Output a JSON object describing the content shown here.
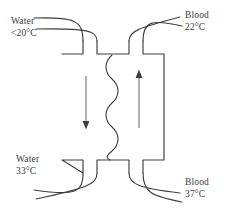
{
  "diagram": {
    "stroke_color": "#3f3f3f",
    "text_color": "#3a3a3a",
    "background_color": "#ffffff",
    "labels": {
      "water_cold": {
        "fluid": "Water",
        "temperature": "<20°C"
      },
      "blood_in": {
        "fluid": "Blood",
        "temperature": "22°C"
      },
      "water_warm": {
        "fluid": "Water",
        "temperature": "33°C"
      },
      "blood_out": {
        "fluid": "Blood",
        "temperature": "37°C"
      }
    },
    "flow": {
      "left_channel_direction": "down",
      "right_channel_direction": "up",
      "membrane": "wavy-divider"
    }
  }
}
